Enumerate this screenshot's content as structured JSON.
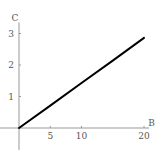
{
  "chart_data": {
    "type": "line",
    "title": "",
    "xlabel": "B",
    "ylabel": "C",
    "xlim": [
      0,
      20.5
    ],
    "ylim": [
      -0.7,
      3.35
    ],
    "grid": false,
    "legend": null,
    "x_ticks": [
      5,
      10,
      20
    ],
    "x_tick_labels": [
      "5",
      "10",
      "20"
    ],
    "y_ticks": [
      1,
      2,
      3
    ],
    "y_tick_labels": [
      "1",
      "2",
      "3"
    ],
    "series": [
      {
        "name": "C(B)",
        "color": "#000000",
        "x": [
          0,
          5,
          10,
          15,
          20
        ],
        "y": [
          0,
          0.71,
          1.43,
          2.14,
          2.86
        ]
      }
    ]
  },
  "colors": {
    "axis": "#999999",
    "line": "#000000",
    "text": "#555555",
    "background": "#ffffff"
  }
}
